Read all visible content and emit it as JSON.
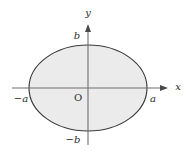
{
  "figure": {
    "background_color": "#ffffff",
    "width": 191,
    "height": 152
  },
  "colors": {
    "background": "#ffffff",
    "ellipse_fill": "#ebebeb",
    "ellipse_stroke": "#3a3a3a",
    "axis_stroke": "#6e6e6e",
    "text": "#2a2a2a"
  },
  "axes": {
    "x_axis": {
      "label": "x",
      "label_x": 178,
      "label_y": 90,
      "line_x1": 12,
      "line_x2": 168,
      "line_y": 88,
      "arrow": "right-arrowhead"
    },
    "y_axis": {
      "label": "y",
      "label_x": 88,
      "label_y": 16,
      "line_y1": 145,
      "line_y2": 24,
      "line_x": 88,
      "arrow": "up-arrowhead"
    }
  },
  "ellipse": {
    "center_x": 88,
    "center_y": 88,
    "semi_axis_a": 59,
    "semi_axis_b": 43,
    "equation": "x^2/a^2 + y^2/b^2 = 1"
  },
  "labels": {
    "origin": {
      "text": "O",
      "x": 78,
      "y": 101
    },
    "b_positive": {
      "text": "b",
      "x": 77,
      "y": 39
    },
    "b_negative": {
      "text": "−b",
      "x": 70,
      "y": 143
    },
    "a_positive": {
      "text": "a",
      "x": 152,
      "y": 102
    },
    "a_negative": {
      "text": "−a",
      "x": 16,
      "y": 102
    }
  }
}
